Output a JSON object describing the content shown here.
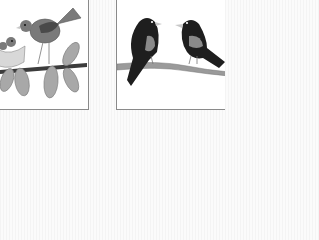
{
  "scene": {
    "description": "Two framed clip-art panels of birds on branches",
    "panels": [
      {
        "id": "left",
        "subject": "mother bird with chicks in nest on leafy branch"
      },
      {
        "id": "right",
        "subject": "two dark birds facing each other on a branch"
      }
    ]
  },
  "colors": {
    "background": "#f7f7f7",
    "panel_bg": "#ffffff",
    "border": "#8a8a8a",
    "bird_gray": "#7a7a7a",
    "wing_dark": "#4a4a4a",
    "leaf_gray": "#a8a8a8",
    "branch_dark": "#3c3c3c",
    "branch_light": "#9a9a9a",
    "black_bird": "#1e1e1e",
    "beak": "#c8c8c8"
  }
}
